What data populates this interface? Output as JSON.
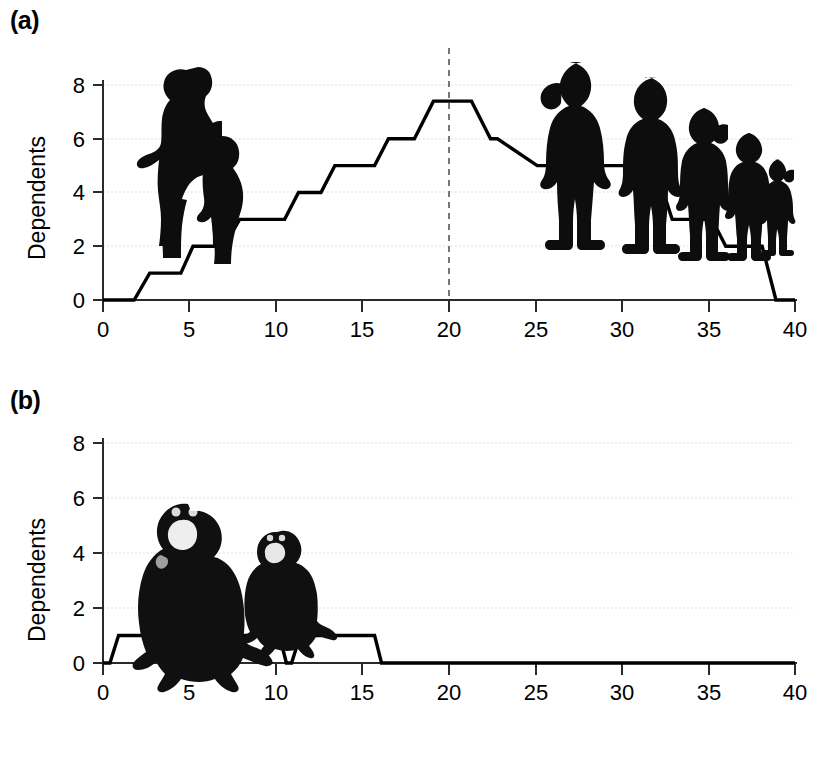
{
  "figure": {
    "panels": [
      {
        "tag": "(a)",
        "species": "human",
        "ylabel": "Dependents",
        "silhouettes": [
          "pregnant-woman-with-toddler",
          "child-large",
          "child-boy",
          "child-girl",
          "child-small",
          "toddler-smallest"
        ]
      },
      {
        "tag": "(b)",
        "species": "chimpanzee",
        "ylabel": "Dependents",
        "silhouettes": [
          "adult-chimpanzee",
          "juvenile-chimpanzee"
        ]
      }
    ],
    "xtitle": "Years since onset of reproduction",
    "axis_colors": {
      "axis": "#1a1a1a",
      "grid": "#d8d8d8",
      "line": "#000000",
      "marker": "#000000"
    }
  },
  "chart_data": [
    {
      "type": "line",
      "panel": "(a)",
      "title": "",
      "xlabel": "Years since onset of reproduction",
      "ylabel": "Dependents",
      "xlim": [
        0,
        40
      ],
      "ylim": [
        0,
        8
      ],
      "xticks": [
        0,
        5,
        10,
        15,
        20,
        25,
        30,
        35,
        40
      ],
      "yticks": [
        0,
        2,
        4,
        6,
        8
      ],
      "xtick_labels": [
        "0",
        "5",
        "10",
        "15",
        "20",
        "25",
        "30",
        "35",
        "40"
      ],
      "ytick_labels": [
        "0",
        "2",
        "4",
        "6",
        "8"
      ],
      "grid": "horizontal-dotted",
      "legend": "none",
      "annotations": [
        {
          "type": "vertical-dashed-line",
          "x": 20,
          "label": ""
        }
      ],
      "step_profile": "cumulative dependents of a human mother rising to a peak of about 7.4 around year 20, then declining stepwise to 0 by year 39",
      "x": [
        0,
        1.8,
        2.7,
        4.5,
        5.2,
        7.0,
        7.9,
        10.5,
        11.3,
        12.6,
        13.4,
        15.7,
        16.5,
        18.0,
        19.1,
        21.3,
        22.4,
        22.8,
        25.1,
        25.9,
        30.6,
        31.6,
        32.4,
        32.9,
        35.2,
        36.0,
        38.1,
        38.9,
        40
      ],
      "y": [
        0,
        0,
        1,
        1,
        2,
        2,
        3,
        3,
        4,
        4,
        5,
        5,
        6,
        6,
        7.4,
        7.4,
        6,
        6,
        5,
        5,
        5,
        4,
        4,
        3,
        3,
        2,
        2,
        0,
        0
      ],
      "peak_value": 7.4,
      "peak_x_range": [
        19.1,
        21.3
      ]
    },
    {
      "type": "line",
      "panel": "(b)",
      "title": "",
      "xlabel": "Years since onset of reproduction",
      "ylabel": "Dependents",
      "xlim": [
        0,
        40
      ],
      "ylim": [
        0,
        8
      ],
      "xticks": [
        0,
        5,
        10,
        15,
        20,
        25,
        30,
        35,
        40
      ],
      "yticks": [
        0,
        2,
        4,
        6,
        8
      ],
      "xtick_labels": [
        "0",
        "5",
        "10",
        "15",
        "20",
        "25",
        "30",
        "35",
        "40"
      ],
      "ytick_labels": [
        "0",
        "2",
        "4",
        "6",
        "8"
      ],
      "grid": "horizontal-dotted",
      "legend": "none",
      "annotations": [],
      "step_profile": "chimpanzee mother supports only one dependent at a time, in three successive non-overlapping bouts ending near year 16",
      "pulses": [
        {
          "start": 0.4,
          "rise_end": 0.9,
          "fall_start": 4.9,
          "end": 5.3,
          "value": 1
        },
        {
          "start": 5.6,
          "rise_end": 6.1,
          "fall_start": 10.2,
          "end": 10.6,
          "value": 1
        },
        {
          "start": 10.9,
          "rise_end": 11.4,
          "fall_start": 15.7,
          "end": 16.1,
          "value": 1
        }
      ],
      "x": [
        0,
        0.4,
        0.9,
        4.9,
        5.3,
        5.6,
        6.1,
        10.2,
        10.6,
        10.9,
        11.4,
        15.7,
        16.1,
        40
      ],
      "y": [
        0,
        0,
        1,
        1,
        0,
        0,
        1,
        1,
        0,
        0,
        1,
        1,
        0,
        0
      ],
      "peak_value": 1
    }
  ]
}
